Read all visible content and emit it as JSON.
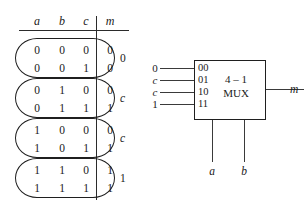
{
  "truth_table": {
    "headers": [
      "a",
      "b",
      "c",
      "m"
    ],
    "rows": [
      {
        "a": "0",
        "b": "0",
        "c": "0",
        "m": "0"
      },
      {
        "a": "0",
        "b": "0",
        "c": "1",
        "m": "0"
      },
      {
        "a": "0",
        "b": "1",
        "c": "0",
        "m": "0"
      },
      {
        "a": "0",
        "b": "1",
        "c": "1",
        "m": "1"
      },
      {
        "a": "1",
        "b": "0",
        "c": "0",
        "m": "0"
      },
      {
        "a": "1",
        "b": "0",
        "c": "1",
        "m": "1"
      },
      {
        "a": "1",
        "b": "1",
        "c": "0",
        "m": "1"
      },
      {
        "a": "1",
        "b": "1",
        "c": "1",
        "m": "1"
      }
    ],
    "group_labels": [
      "0",
      "c",
      "c",
      "1"
    ]
  },
  "mux": {
    "title": "4 – 1",
    "subtitle": "MUX",
    "select_codes": [
      "00",
      "01",
      "10",
      "11"
    ],
    "input_labels": [
      "0",
      "c",
      "c",
      "1"
    ],
    "output_label": "m",
    "select_labels": [
      "a",
      "b"
    ]
  }
}
